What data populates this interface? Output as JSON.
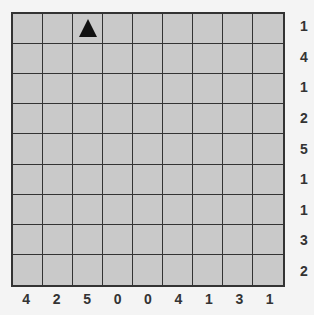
{
  "puzzle": {
    "rows": 9,
    "cols": 9,
    "row_clues": [
      "1",
      "4",
      "1",
      "2",
      "5",
      "1",
      "1",
      "3",
      "2"
    ],
    "col_clues": [
      "4",
      "2",
      "5",
      "0",
      "0",
      "4",
      "1",
      "3",
      "1"
    ],
    "markers": [
      {
        "row": 0,
        "col": 2,
        "icon": "triangle-icon"
      }
    ],
    "colors": {
      "background": "#f4f4f4",
      "cell": "#c9c9c9",
      "grid_line": "#333333",
      "marker": "#111111",
      "clue_text": "#333333"
    }
  }
}
